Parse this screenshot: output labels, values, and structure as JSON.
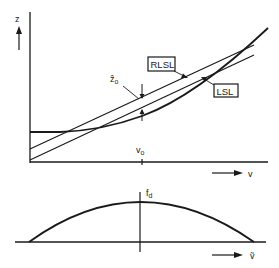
{
  "top_plot": {
    "y_axis_label": "z",
    "x_axis_label": "v",
    "x_tick_label": "v",
    "x_tick_subscript": "o",
    "marker_label": "ẑ",
    "marker_subscript": "o",
    "curves": [
      {
        "id": "nonlinear-curve",
        "label": ""
      },
      {
        "id": "rlsl-line",
        "label": "RLSL"
      },
      {
        "id": "lsl-line",
        "label": "LSL"
      }
    ]
  },
  "bottom_plot": {
    "y_axis_label": "f",
    "y_axis_subscript": "d",
    "x_axis_label": "ṽ",
    "curve": "density-arc"
  },
  "colors": {
    "ink": "#1a1a1a",
    "background": "#ffffff"
  }
}
